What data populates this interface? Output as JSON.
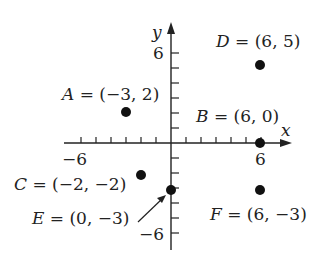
{
  "header_fragment": "(c) ... (d) ... right by ...",
  "axes": {
    "x_label": "x",
    "y_label": "y",
    "x_tick_labels": {
      "neg": "−6",
      "pos": "6"
    },
    "y_tick_labels": {
      "pos": "6",
      "neg": "−6"
    },
    "range": [
      -6,
      6
    ]
  },
  "points": [
    {
      "name": "A",
      "label": "A = (−3, 2)",
      "x": -3,
      "y": 2
    },
    {
      "name": "B",
      "label": "B = (6, 0)",
      "x": 6,
      "y": 0
    },
    {
      "name": "C",
      "label": "C = (−2, −2)",
      "x": -2,
      "y": -2
    },
    {
      "name": "D",
      "label": "D = (6, 5)",
      "x": 6,
      "y": 5
    },
    {
      "name": "E",
      "label": "E = (0, −3)",
      "x": 0,
      "y": -3
    },
    {
      "name": "F",
      "label": "F = (6, −3)",
      "x": 6,
      "y": -3
    }
  ],
  "chart_data": {
    "type": "scatter",
    "title": "",
    "xlabel": "x",
    "ylabel": "y",
    "xlim": [
      -6,
      6
    ],
    "ylim": [
      -6,
      6
    ],
    "grid": false,
    "series": [
      {
        "name": "points",
        "labels": [
          "A",
          "B",
          "C",
          "D",
          "E",
          "F"
        ],
        "x": [
          -3,
          6,
          -2,
          6,
          0,
          6
        ],
        "y": [
          2,
          0,
          -2,
          5,
          -3,
          -3
        ]
      }
    ]
  }
}
